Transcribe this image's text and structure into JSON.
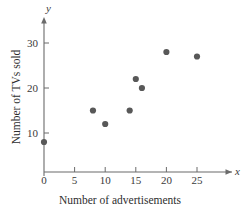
{
  "chart_data": {
    "type": "scatter",
    "title": "",
    "xlabel": "Number of advertisements",
    "ylabel": "Number of TVs sold",
    "x_axis_symbol": "x",
    "y_axis_symbol": "y",
    "xlim": [
      0,
      27
    ],
    "ylim": [
      0,
      33
    ],
    "xticks": [
      0,
      5,
      10,
      15,
      20,
      25
    ],
    "yticks": [
      10,
      20,
      30
    ],
    "xtick_labels": [
      "0",
      "5",
      "10",
      "15",
      "20",
      "25"
    ],
    "ytick_labels": [
      "10",
      "20",
      "30"
    ],
    "grid": false,
    "legend": false,
    "marker_color": "#585858",
    "axis_color": "#6b6b6b",
    "points": [
      {
        "x": 0,
        "y": 8
      },
      {
        "x": 8,
        "y": 15
      },
      {
        "x": 10,
        "y": 12
      },
      {
        "x": 14,
        "y": 15
      },
      {
        "x": 15,
        "y": 22
      },
      {
        "x": 16,
        "y": 20
      },
      {
        "x": 20,
        "y": 28
      },
      {
        "x": 25,
        "y": 27
      }
    ]
  }
}
